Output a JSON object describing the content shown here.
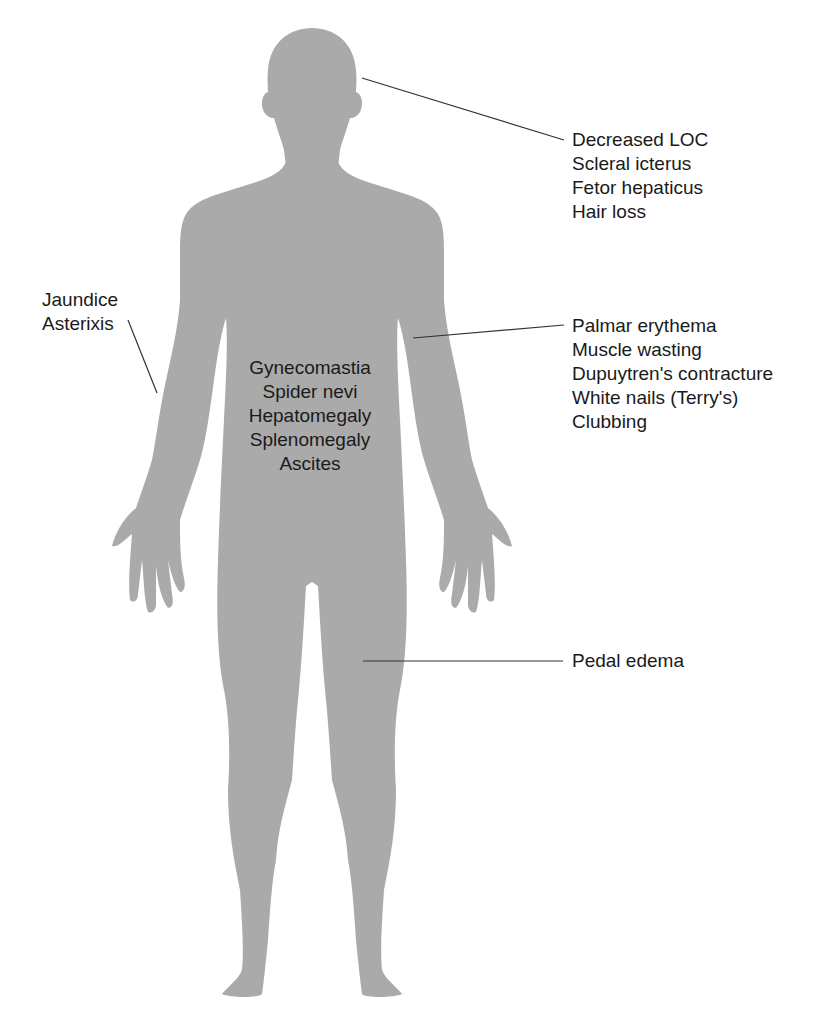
{
  "figure": {
    "silhouette_color": "#aaaaaa",
    "leader_line_color": "#333333",
    "text_color": "#1a1a1a"
  },
  "labels": {
    "head": {
      "items": [
        "Decreased LOC",
        "Scleral icterus",
        "Fetor hepaticus",
        "Hair loss"
      ]
    },
    "left_arm": {
      "items": [
        "Jaundice",
        "Asterixis"
      ]
    },
    "torso": {
      "items": [
        "Gynecomastia",
        "Spider nevi",
        "Hepatomegaly",
        "Splenomegaly",
        "Ascites"
      ]
    },
    "right_arm": {
      "items": [
        "Palmar erythema",
        "Muscle wasting",
        "Dupuytren's contracture",
        "White nails (Terry's)",
        "Clubbing"
      ]
    },
    "leg": {
      "items": [
        "Pedal edema"
      ]
    }
  }
}
